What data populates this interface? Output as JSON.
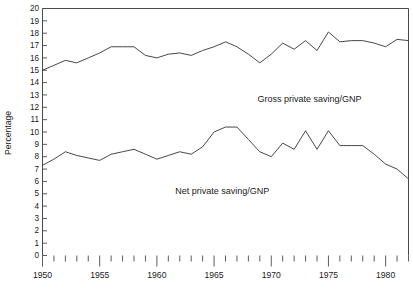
{
  "chart_data": {
    "type": "line",
    "title": "",
    "xlabel": "",
    "ylabel": "Percentage",
    "xlim": [
      1950,
      1982
    ],
    "ylim": [
      0,
      20
    ],
    "grid": false,
    "legend_position": "inline-annotations",
    "x_tick_interval": 1,
    "x_major_tick_interval": 5,
    "y_tick_interval": 1,
    "x_tick_labels": [
      "1950",
      "1955",
      "1960",
      "1965",
      "1970",
      "1975",
      "1980"
    ],
    "x_tick_label_values": [
      1950,
      1955,
      1960,
      1965,
      1970,
      1975,
      1980
    ],
    "y_tick_labels": [
      "0",
      "1",
      "2",
      "3",
      "4",
      "5",
      "6",
      "7",
      "8",
      "9",
      "10",
      "11",
      "12",
      "13",
      "14",
      "15",
      "16",
      "17",
      "18",
      "19",
      "20"
    ],
    "x": [
      1950,
      1951,
      1952,
      1953,
      1954,
      1955,
      1956,
      1957,
      1958,
      1959,
      1960,
      1961,
      1962,
      1963,
      1964,
      1965,
      1966,
      1967,
      1968,
      1969,
      1970,
      1971,
      1972,
      1973,
      1974,
      1975,
      1976,
      1977,
      1978,
      1979,
      1980,
      1981,
      1982
    ],
    "series": [
      {
        "name": "Gross private saving/GNP",
        "color": "#333333",
        "label_annotation": "Gross private saving/GNP",
        "values": [
          15.0,
          15.4,
          15.8,
          15.6,
          16.0,
          16.4,
          16.9,
          16.9,
          16.9,
          16.2,
          16.0,
          16.3,
          16.4,
          16.2,
          16.6,
          16.9,
          17.3,
          16.9,
          16.3,
          15.6,
          16.3,
          17.2,
          16.7,
          17.4,
          16.6,
          18.1,
          17.3,
          17.4,
          17.4,
          17.2,
          16.9,
          17.5,
          17.4
        ]
      },
      {
        "name": "Net private saving/GNP",
        "color": "#333333",
        "label_annotation": "Net private saving/GNP",
        "values": [
          7.3,
          7.8,
          8.4,
          8.1,
          7.9,
          7.7,
          8.2,
          8.4,
          8.6,
          8.2,
          7.8,
          8.1,
          8.4,
          8.2,
          8.8,
          10.0,
          10.4,
          10.4,
          9.4,
          8.4,
          8.0,
          9.1,
          8.6,
          10.1,
          8.6,
          10.1,
          8.9,
          8.9,
          8.9,
          8.2,
          7.4,
          7.0,
          6.2
        ]
      }
    ],
    "annotations": [
      {
        "text": "Gross private saving/GNP",
        "x": 1968.8,
        "y": 12.4
      },
      {
        "text": "Net private saving/GNP",
        "x": 1961.6,
        "y": 5.0
      }
    ]
  }
}
